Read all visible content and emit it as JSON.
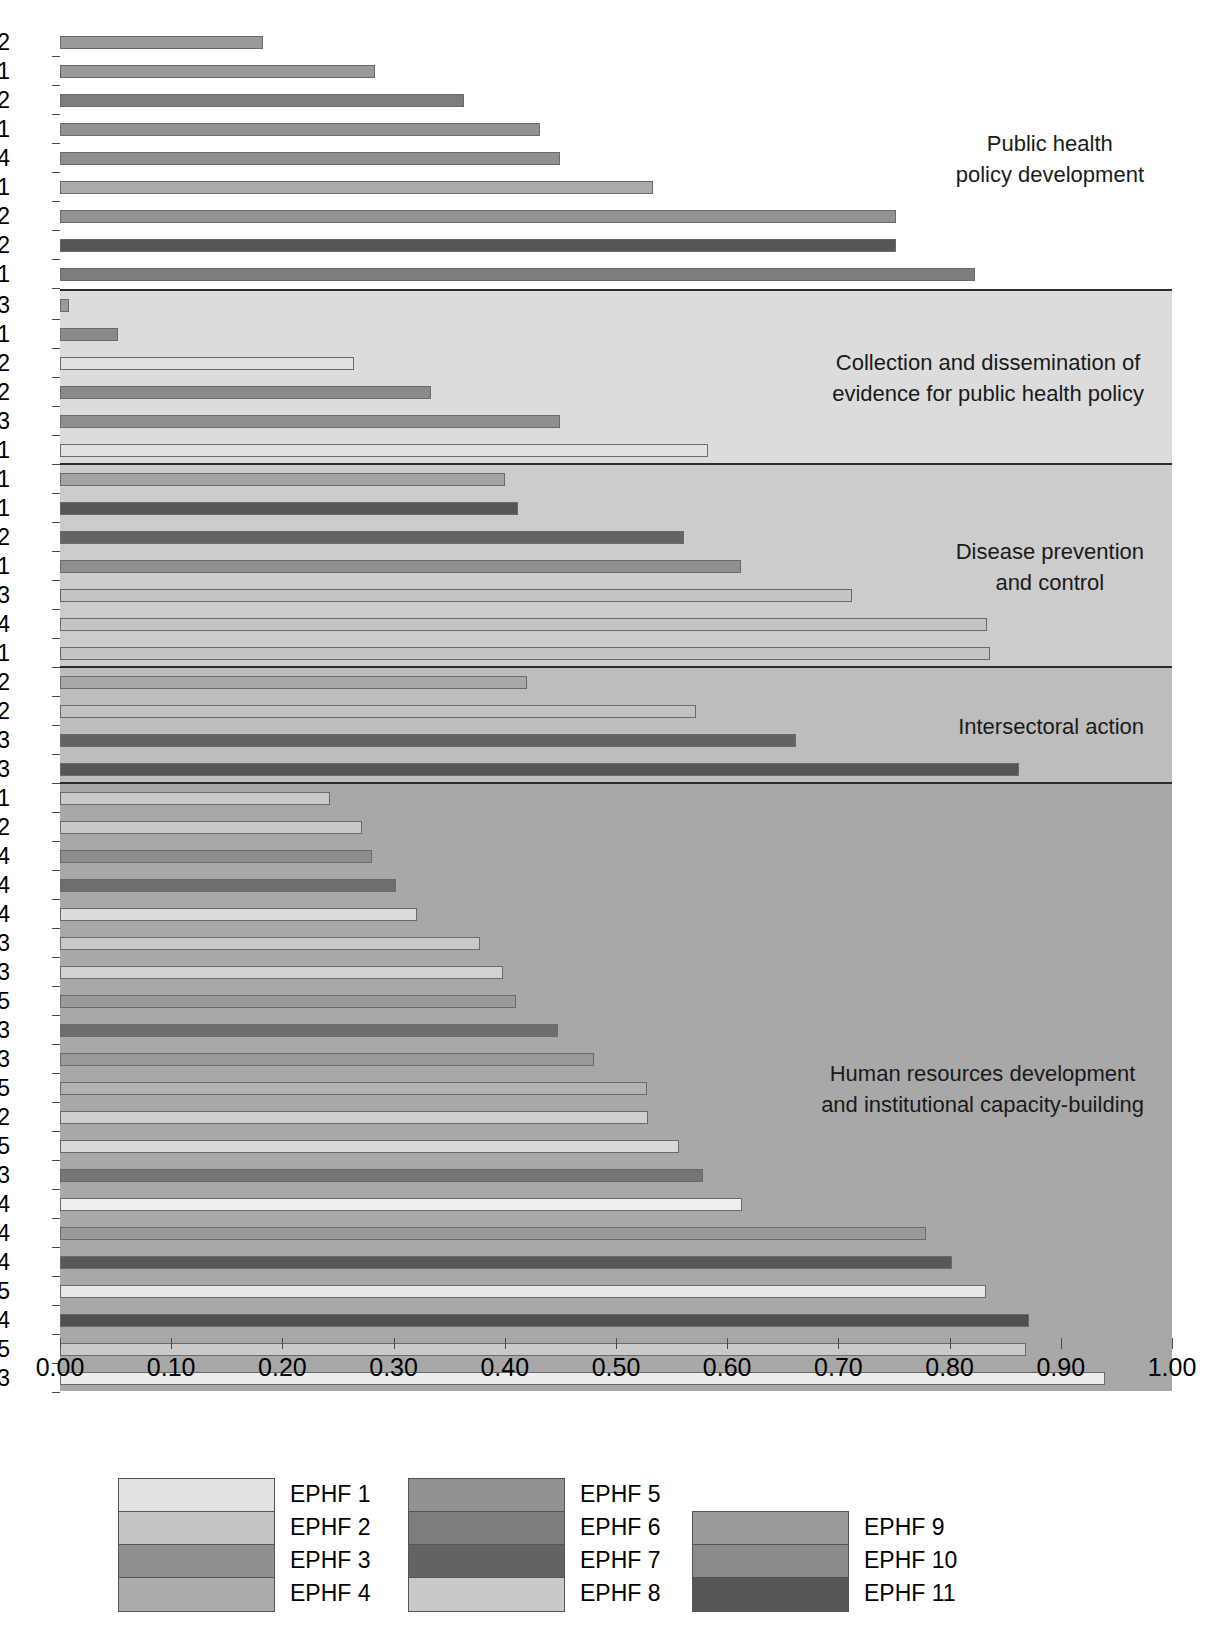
{
  "chart_data": {
    "type": "bar",
    "orientation": "horizontal",
    "title": "",
    "xlabel": "",
    "ylabel": "",
    "xlim": [
      0,
      1
    ],
    "grid": false,
    "legend_position": "bottom",
    "x_ticks": [
      "0.00",
      "0.10",
      "0.20",
      "0.30",
      "0.40",
      "0.50",
      "0.60",
      "0.70",
      "0.80",
      "0.90",
      "1.00"
    ],
    "legend": [
      {
        "label": "EPHF 1",
        "color": "#e2e2e2"
      },
      {
        "label": "EPHF 2",
        "color": "#c4c4c4"
      },
      {
        "label": "EPHF 3",
        "color": "#8f8f8f"
      },
      {
        "label": "EPHF 4",
        "color": "#ababab"
      },
      {
        "label": "EPHF 5",
        "color": "#929292"
      },
      {
        "label": "EPHF 6",
        "color": "#7d7d7d"
      },
      {
        "label": "EPHF 7",
        "color": "#636363"
      },
      {
        "label": "EPHF 8",
        "color": "#c9c9c9"
      },
      {
        "label": "EPHF 9",
        "color": "#9a9a9a"
      },
      {
        "label": "EPHF 10",
        "color": "#8a8a8a"
      },
      {
        "label": "EPHF 11",
        "color": "#565656"
      }
    ],
    "groups": [
      {
        "name": "Public health\npolicy development",
        "background": "#ffffff",
        "bars": [
          {
            "label": "9.2",
            "value": 0.183,
            "series": "EPHF 9",
            "color": "#9a9a9a"
          },
          {
            "label": "9.1",
            "value": 0.283,
            "series": "EPHF 9",
            "color": "#9a9a9a"
          },
          {
            "label": "6.2",
            "value": 0.363,
            "series": "EPHF 6",
            "color": "#7d7d7d"
          },
          {
            "label": "5.1",
            "value": 0.432,
            "series": "EPHF 5",
            "color": "#929292"
          },
          {
            "label": "3.4",
            "value": 0.45,
            "series": "EPHF 3",
            "color": "#8f8f8f"
          },
          {
            "label": "4.1",
            "value": 0.533,
            "series": "EPHF 4",
            "color": "#ababab"
          },
          {
            "label": "5.2",
            "value": 0.752,
            "series": "EPHF 5",
            "color": "#929292"
          },
          {
            "label": "11.2",
            "value": 0.752,
            "series": "EPHF 11",
            "color": "#565656"
          },
          {
            "label": "6.1",
            "value": 0.823,
            "series": "EPHF 6",
            "color": "#7d7d7d"
          }
        ]
      },
      {
        "name": "Collection and dissemination of\nevidence for public health policy",
        "background": "#dcdcdc",
        "bars": [
          {
            "label": "9.3",
            "value": 0.008,
            "series": "EPHF 9",
            "color": "#9a9a9a"
          },
          {
            "label": "10.1",
            "value": 0.052,
            "series": "EPHF 10",
            "color": "#8a8a8a"
          },
          {
            "label": "1.2",
            "value": 0.264,
            "series": "EPHF 1",
            "color": "#e2e2e2"
          },
          {
            "label": "10.2",
            "value": 0.334,
            "series": "EPHF 10",
            "color": "#8a8a8a"
          },
          {
            "label": "3.3",
            "value": 0.45,
            "series": "EPHF 3",
            "color": "#8f8f8f"
          },
          {
            "label": "1.1",
            "value": 0.583,
            "series": "EPHF 1",
            "color": "#e2e2e2"
          }
        ]
      },
      {
        "name": "Disease prevention\nand control",
        "background": "#cccccc",
        "bars": [
          {
            "label": "7.1",
            "value": 0.4,
            "series": "EPHF 7",
            "color": "#a3a3a3"
          },
          {
            "label": "11.1",
            "value": 0.412,
            "series": "EPHF 11",
            "color": "#565656"
          },
          {
            "label": "7.2",
            "value": 0.561,
            "series": "EPHF 7",
            "color": "#636363"
          },
          {
            "label": "3.1",
            "value": 0.612,
            "series": "EPHF 3",
            "color": "#8f8f8f"
          },
          {
            "label": "2.3",
            "value": 0.712,
            "series": "EPHF 2",
            "color": "#c4c4c4"
          },
          {
            "label": "2.4",
            "value": 0.834,
            "series": "EPHF 2",
            "color": "#c4c4c4"
          },
          {
            "label": "2.1",
            "value": 0.836,
            "series": "EPHF 2",
            "color": "#c4c4c4"
          }
        ]
      },
      {
        "name": "Intersectoral action",
        "background": "#bdbdbd",
        "bars": [
          {
            "label": "3.2",
            "value": 0.42,
            "series": "EPHF 3",
            "color": "#a8a8a8"
          },
          {
            "label": "4.2",
            "value": 0.572,
            "series": "EPHF 4",
            "color": "#c2c2c2"
          },
          {
            "label": "7.3",
            "value": 0.662,
            "series": "EPHF 7",
            "color": "#636363"
          },
          {
            "label": "11.3",
            "value": 0.862,
            "series": "EPHF 11",
            "color": "#565656"
          }
        ]
      },
      {
        "name": "Human resources development\nand institutional capacity-building",
        "background": "#a8a8a8",
        "bars": [
          {
            "label": "8.1",
            "value": 0.243,
            "series": "EPHF 8",
            "color": "#c9c9c9"
          },
          {
            "label": "8.2",
            "value": 0.272,
            "series": "EPHF 8",
            "color": "#c9c9c9"
          },
          {
            "label": "9.4",
            "value": 0.281,
            "series": "EPHF 9",
            "color": "#8d8d8d"
          },
          {
            "label": "6.4",
            "value": 0.302,
            "series": "EPHF 6",
            "color": "#6e6e6e"
          },
          {
            "label": "8.4",
            "value": 0.321,
            "series": "EPHF 8",
            "color": "#dcdcdc"
          },
          {
            "label": "4.3",
            "value": 0.378,
            "series": "EPHF 4",
            "color": "#c9c9c9"
          },
          {
            "label": "8.3",
            "value": 0.398,
            "series": "EPHF 8",
            "color": "#d2d2d2"
          },
          {
            "label": "5.5",
            "value": 0.41,
            "series": "EPHF 5",
            "color": "#9a9a9a"
          },
          {
            "label": "6.3",
            "value": 0.448,
            "series": "EPHF 6",
            "color": "#6e6e6e"
          },
          {
            "label": "5.3",
            "value": 0.48,
            "series": "EPHF 5",
            "color": "#999999"
          },
          {
            "label": "3.5",
            "value": 0.528,
            "series": "EPHF 3",
            "color": "#b2b2b2"
          },
          {
            "label": "2.2",
            "value": 0.529,
            "series": "EPHF 2",
            "color": "#cfcfcf"
          },
          {
            "label": "8.5",
            "value": 0.557,
            "series": "EPHF 8",
            "color": "#d9d9d9"
          },
          {
            "label": "10.3",
            "value": 0.578,
            "series": "EPHF 10",
            "color": "#757575"
          },
          {
            "label": "1.4",
            "value": 0.613,
            "series": "EPHF 1",
            "color": "#efefef"
          },
          {
            "label": "5.4",
            "value": 0.779,
            "series": "EPHF 5",
            "color": "#9a9a9a"
          },
          {
            "label": "7.4",
            "value": 0.802,
            "series": "EPHF 7",
            "color": "#585858"
          },
          {
            "label": "1.5",
            "value": 0.833,
            "series": "EPHF 1",
            "color": "#e8e8e8"
          },
          {
            "label": "11.4",
            "value": 0.871,
            "series": "EPHF 11",
            "color": "#4f4f4f"
          },
          {
            "label": "2.5",
            "value": 0.869,
            "series": "EPHF 2",
            "color": "#cacaca"
          },
          {
            "label": "1.3",
            "value": 0.94,
            "series": "EPHF 1",
            "color": "#ededed"
          }
        ]
      }
    ]
  }
}
